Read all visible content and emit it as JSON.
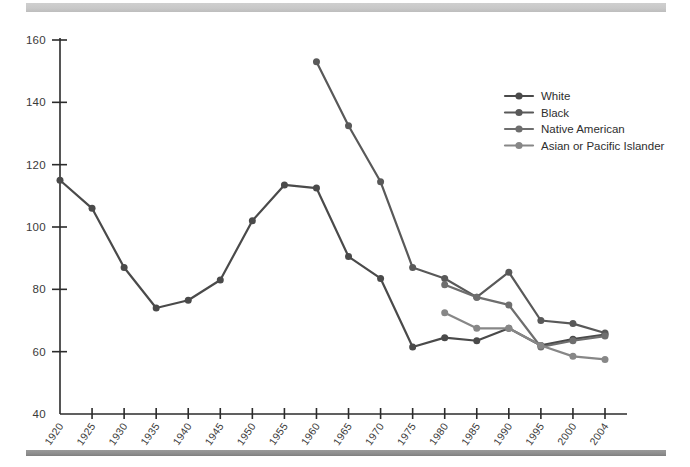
{
  "figure": {
    "background_color": "#ffffff",
    "top_rule_color": "#c9c9c9",
    "bottom_rule_color": "#8e8e8e"
  },
  "chart_data": {
    "type": "line",
    "title": "",
    "subtitle": "",
    "xlabel": "",
    "ylabel": "",
    "grid": false,
    "legend_position": "upper-right",
    "x": [
      1920,
      1925,
      1930,
      1935,
      1940,
      1945,
      1950,
      1955,
      1960,
      1965,
      1970,
      1975,
      1980,
      1985,
      1990,
      1995,
      2000,
      2004
    ],
    "xtick_labels": [
      "1920",
      "1925",
      "1930",
      "1935",
      "1940",
      "1945",
      "1950",
      "1955",
      "1960",
      "1965",
      "1970",
      "1975",
      "1980",
      "1985",
      "1990",
      "1995",
      "2000",
      "2004"
    ],
    "ylim": [
      40,
      160
    ],
    "ytick_values": [
      40,
      60,
      80,
      100,
      120,
      140,
      160
    ],
    "ytick_labels": [
      "40",
      "60",
      "80",
      "100",
      "120",
      "140",
      "160"
    ],
    "series": [
      {
        "name": "White",
        "color": "#4a4a4a",
        "x": [
          1920,
          1925,
          1930,
          1935,
          1940,
          1945,
          1950,
          1955,
          1960,
          1965,
          1970,
          1975,
          1980,
          1985,
          1990,
          1995,
          2000,
          2004
        ],
        "values": [
          115,
          106,
          87,
          74,
          76.5,
          83,
          102,
          113.5,
          112.5,
          90.5,
          83.5,
          61.5,
          64.5,
          63.5,
          67.5,
          62,
          64,
          65.5
        ]
      },
      {
        "name": "Black",
        "color": "#595959",
        "x": [
          1960,
          1965,
          1970,
          1975,
          1980,
          1985,
          1990,
          1995,
          2000,
          2004
        ],
        "values": [
          153,
          132.5,
          114.5,
          87,
          83.5,
          77.5,
          85.5,
          70,
          69,
          66
        ]
      },
      {
        "name": "Native American",
        "color": "#6e6e6e",
        "x": [
          1980,
          1985,
          1990,
          1995,
          2000,
          2004
        ],
        "values": [
          81.5,
          77.5,
          75,
          61.5,
          63.5,
          65
        ]
      },
      {
        "name": "Asian or Pacific Islander",
        "color": "#878787",
        "x": [
          1980,
          1985,
          1990,
          1995,
          2000,
          2004
        ],
        "values": [
          72.5,
          67.5,
          67.5,
          62,
          58.5,
          57.5
        ]
      }
    ]
  },
  "legend": {
    "items": [
      {
        "label": "White",
        "color": "#4a4a4a"
      },
      {
        "label": "Black",
        "color": "#595959"
      },
      {
        "label": "Native American",
        "color": "#6e6e6e"
      },
      {
        "label": "Asian or Pacific Islander",
        "color": "#878787"
      }
    ]
  }
}
